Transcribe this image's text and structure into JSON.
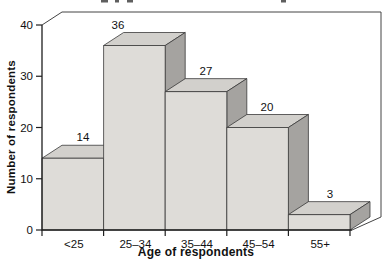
{
  "figure": {
    "background": "#ffffff",
    "title_visible": false
  },
  "chart_data": {
    "type": "bar",
    "subtype": "3d-histogram",
    "title": "",
    "categories": [
      "<25",
      "25–34",
      "35–44",
      "45–54",
      "55+"
    ],
    "values": [
      14,
      36,
      27,
      20,
      3
    ],
    "bar_value_labels": [
      "14",
      "36",
      "27",
      "20",
      "3"
    ],
    "xlabel": "Age of respondents",
    "ylabel": "Number of respondents",
    "ylim": [
      0,
      40
    ],
    "yticks": [
      0,
      10,
      20,
      30,
      40
    ],
    "ytick_labels": [
      "0",
      "10",
      "20",
      "30",
      "40"
    ],
    "grid": "off",
    "legend": "none",
    "colors": {
      "bar_front": "#dedcd8",
      "bar_top": "#d2d0cc",
      "bar_side": "#a5a3a0",
      "outline": "#3a3a3a",
      "axis": "#1f1f1f",
      "text": "#111111",
      "backdrop_line": "#444444"
    }
  }
}
